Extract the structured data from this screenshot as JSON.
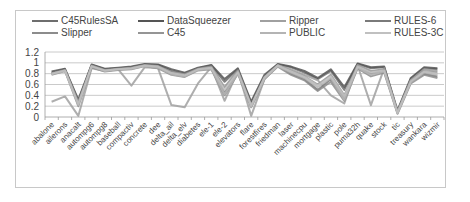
{
  "chart_data": {
    "type": "line",
    "title": "",
    "xlabel": "",
    "ylabel": "",
    "ylim": [
      0,
      1.2
    ],
    "yticks": [
      "0",
      "0.2",
      "0.4",
      "0.6",
      "0.8",
      "1",
      "1.2"
    ],
    "grid": true,
    "legend_position": "top",
    "categories": [
      "abalone",
      "ailerons",
      "anacalt",
      "autompg6",
      "autompg8",
      "baseball",
      "compactiv",
      "concrete",
      "dee",
      "delta_ail",
      "delta_elv",
      "diabetes",
      "ele-1",
      "ele-2",
      "elevators",
      "flare",
      "forestfires",
      "friedman",
      "laser",
      "machinecpu",
      "mortgage",
      "plastic",
      "pole",
      "puma32h",
      "quake",
      "stock",
      "tic",
      "treasury",
      "wankara",
      "wizmir"
    ],
    "series": [
      {
        "name": "C45RulesSA",
        "color": "#6e6e6e",
        "values": [
          0.82,
          0.88,
          0.3,
          0.96,
          0.88,
          0.9,
          0.92,
          0.97,
          0.96,
          0.85,
          0.8,
          0.9,
          0.95,
          0.65,
          0.88,
          0.25,
          0.75,
          0.97,
          0.92,
          0.82,
          0.7,
          0.85,
          0.5,
          0.98,
          0.9,
          0.92,
          0.1,
          0.7,
          0.9,
          0.88
        ]
      },
      {
        "name": "DataSqueezer",
        "color": "#555555",
        "values": [
          0.84,
          0.89,
          0.32,
          0.97,
          0.89,
          0.91,
          0.93,
          0.98,
          0.97,
          0.88,
          0.82,
          0.91,
          0.96,
          0.7,
          0.9,
          0.28,
          0.78,
          0.98,
          0.93,
          0.85,
          0.72,
          0.88,
          0.55,
          0.99,
          0.92,
          0.93,
          0.12,
          0.72,
          0.92,
          0.9
        ]
      },
      {
        "name": "Ripper",
        "color": "#a0a0a0",
        "values": [
          0.28,
          0.38,
          0.02,
          0.9,
          0.85,
          0.88,
          0.58,
          0.92,
          0.9,
          0.22,
          0.18,
          0.62,
          0.92,
          0.3,
          0.85,
          0.02,
          0.7,
          0.95,
          0.88,
          0.78,
          0.68,
          0.4,
          0.25,
          0.95,
          0.22,
          0.9,
          0.1,
          0.68,
          0.88,
          0.85
        ]
      },
      {
        "name": "RULES-6",
        "color": "#7a7a7a",
        "values": [
          0.8,
          0.86,
          0.25,
          0.94,
          0.86,
          0.88,
          0.9,
          0.95,
          0.92,
          0.8,
          0.76,
          0.88,
          0.9,
          0.45,
          0.82,
          0.2,
          0.72,
          0.95,
          0.8,
          0.7,
          0.5,
          0.7,
          0.35,
          0.92,
          0.8,
          0.85,
          0.08,
          0.65,
          0.8,
          0.75
        ]
      },
      {
        "name": "Slipper",
        "color": "#8c8c8c",
        "values": [
          0.78,
          0.85,
          0.2,
          0.92,
          0.84,
          0.87,
          0.88,
          0.94,
          0.9,
          0.78,
          0.74,
          0.86,
          0.88,
          0.4,
          0.8,
          0.18,
          0.7,
          0.93,
          0.78,
          0.68,
          0.48,
          0.65,
          0.3,
          0.9,
          0.75,
          0.82,
          0.06,
          0.62,
          0.78,
          0.72
        ]
      },
      {
        "name": "C45",
        "color": "#959595",
        "values": [
          0.81,
          0.87,
          0.28,
          0.95,
          0.87,
          0.89,
          0.91,
          0.96,
          0.94,
          0.83,
          0.79,
          0.89,
          0.93,
          0.55,
          0.86,
          0.22,
          0.74,
          0.96,
          0.85,
          0.75,
          0.6,
          0.78,
          0.4,
          0.96,
          0.85,
          0.88,
          0.09,
          0.68,
          0.85,
          0.82
        ]
      },
      {
        "name": "PUBLIC",
        "color": "#b4b4b4",
        "values": [
          0.79,
          0.85,
          0.22,
          0.93,
          0.85,
          0.88,
          0.89,
          0.94,
          0.91,
          0.79,
          0.75,
          0.87,
          0.89,
          0.42,
          0.81,
          0.19,
          0.71,
          0.94,
          0.82,
          0.72,
          0.55,
          0.72,
          0.32,
          0.91,
          0.78,
          0.84,
          0.07,
          0.64,
          0.82,
          0.78
        ]
      },
      {
        "name": "RULES-3C",
        "color": "#c0c0c0",
        "values": [
          0.8,
          0.86,
          0.24,
          0.94,
          0.86,
          0.88,
          0.9,
          0.95,
          0.93,
          0.81,
          0.77,
          0.88,
          0.91,
          0.5,
          0.83,
          0.21,
          0.73,
          0.95,
          0.84,
          0.74,
          0.58,
          0.75,
          0.38,
          0.93,
          0.82,
          0.86,
          0.08,
          0.66,
          0.84,
          0.8
        ]
      }
    ]
  }
}
